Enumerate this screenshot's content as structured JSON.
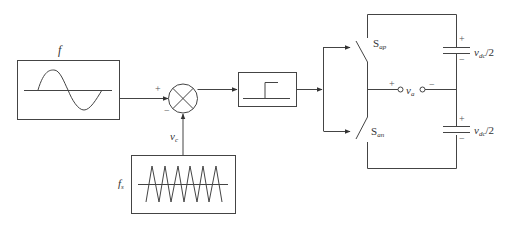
{
  "diagram": {
    "reference_block": {
      "label": "f",
      "waveform": "sine"
    },
    "carrier_block": {
      "label": "f",
      "label_sub": "s",
      "waveform": "triangle",
      "cycles": 6
    },
    "summing_junction": {
      "plus_sign": "+",
      "minus_sign": "−"
    },
    "carrier_signal": {
      "label": "v",
      "label_sub": "c"
    },
    "comparator_block": {
      "waveform": "step"
    },
    "switches": {
      "upper": {
        "label": "S",
        "label_sub": "ap"
      },
      "lower": {
        "label": "S",
        "label_sub": "an"
      }
    },
    "output": {
      "label": "v",
      "label_sub": "a",
      "plus_sign": "+",
      "minus_sign": "−"
    },
    "capacitors": [
      {
        "label": "v",
        "label_sub": "dc",
        "label_tail": "/2",
        "plus_sign": "+",
        "minus_sign": "−"
      },
      {
        "label": "v",
        "label_sub": "dc",
        "label_tail": "/2",
        "plus_sign": "+",
        "minus_sign": "−"
      }
    ],
    "colors": {
      "line": "#444444",
      "background": "#ffffff"
    }
  }
}
